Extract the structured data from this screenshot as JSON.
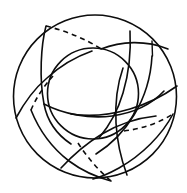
{
  "figure": {
    "background_color": "#ffffff",
    "ink_color": "#0d0d0d",
    "canvas": {
      "width": 187,
      "height": 193
    },
    "line_style_names": [
      "solid",
      "dashed"
    ],
    "dash_pattern": "5 4",
    "stroke_width_outer": 1.6,
    "stroke_width_inner": 1.6,
    "stroke_width_arc": 1.6,
    "stroke_width_tick": 1.4
  },
  "shapes": {
    "outer_circle": {
      "name": "outer-circle",
      "cx": 95,
      "cy": 96.5,
      "r": 81.5,
      "style": "solid"
    },
    "inner_circle": {
      "name": "inner-circle",
      "cx": 93,
      "cy": 93.5,
      "r": 45.5,
      "style": "solid"
    },
    "tick_mark": {
      "name": "radius-tick-mark",
      "x1": 152,
      "y1": 41,
      "x2": 152.5,
      "y2": 56,
      "style": "solid"
    },
    "arcs": [
      {
        "name": "arc-1-solid",
        "style": "solid",
        "d": "M 46 26 C 41 45 39 78 44 104 C 47 120 56 134 71 144"
      },
      {
        "name": "arc-1-dashed",
        "style": "dashed",
        "d": "M 46 26 C 66 31 86 39 101 49"
      },
      {
        "name": "arc-2-solid",
        "style": "solid",
        "d": "M 101 49 C 121 41 146 40 168 49"
      },
      {
        "name": "arc-2-continuation",
        "style": "solid",
        "d": "M 44 104 C 63 114 89 119 112 116 C 133 113 152 104 164 91"
      },
      {
        "name": "arc-3-solid",
        "style": "solid",
        "d": "M 152 56 C 151 75 145 97 134 115 C 125 130 112 144 96 154"
      },
      {
        "name": "arc-3-dashed",
        "style": "dashed",
        "d": "M 124 131 C 141 129 159 123 173 114"
      },
      {
        "name": "arc-4-solid",
        "style": "solid",
        "d": "M 173 114 C 162 135 142 155 119 168 C 110 173 101 177 93 179"
      },
      {
        "name": "arc-4-dashed",
        "style": "dashed",
        "d": "M 78 143 C 87 157 99 171 111 181"
      },
      {
        "name": "arc-5-solid",
        "style": "solid",
        "d": "M 111 181 C 96 177 81 170 69 161 C 52 148 39 130 31 110"
      },
      {
        "name": "arc-5-dashed",
        "style": "dashed",
        "d": "M 31 110 C 36 98 44 86 53 76"
      },
      {
        "name": "arc-6-solid",
        "style": "solid",
        "d": "M 16 118 C 24 103 34 89 47 78 C 60 66 75 57 92 51"
      },
      {
        "name": "arc-7-solid",
        "style": "solid",
        "d": "M 130 31 C 131 50 129 73 123 93 C 118 110 110 125 99 138"
      },
      {
        "name": "arc-8-solid",
        "style": "solid",
        "d": "M 177 86 C 163 96 147 104 130 109 C 110 115 90 117 71 114"
      },
      {
        "name": "arc-9-solid",
        "style": "solid",
        "d": "M 127 175 C 121 159 117 141 116 123 C 115 104 117 85 123 68"
      },
      {
        "name": "arc-10-solid",
        "style": "solid",
        "d": "M 61 168 C 73 155 87 143 102 134 C 119 124 137 118 156 116"
      }
    ]
  }
}
